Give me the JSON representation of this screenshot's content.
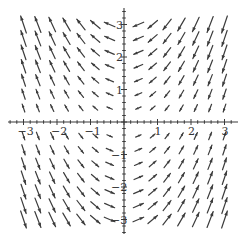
{
  "chart_data": {
    "type": "vector-field",
    "title": "",
    "xlabel": "",
    "ylabel": "",
    "field": {
      "u": "-y",
      "v": "-x*y"
    },
    "xlim": [
      -3.4,
      3.4
    ],
    "ylim": [
      -3.5,
      3.6
    ],
    "grid": false,
    "legend": null,
    "x_ticks": [
      -3,
      -2,
      -1,
      1,
      2,
      3
    ],
    "y_ticks": [
      -3,
      -2,
      -1,
      1,
      2,
      3
    ],
    "x_tick_labels": [
      "−3",
      "−2",
      "−1",
      "1",
      "2",
      "3"
    ],
    "y_tick_labels": [
      "−3",
      "−2",
      "−1",
      "1",
      "2",
      "3"
    ],
    "arrow_grid": {
      "x": [
        -3.0,
        -2.571,
        -2.143,
        -1.714,
        -1.286,
        -0.857,
        -0.429,
        0.429,
        0.857,
        1.286,
        1.714,
        2.143,
        2.571,
        3.0
      ],
      "y": [
        -3.0,
        -2.571,
        -2.143,
        -1.714,
        -1.286,
        -0.857,
        -0.429,
        0.429,
        0.857,
        1.286,
        1.714,
        2.143,
        2.571,
        3.0
      ]
    },
    "colors": {
      "arrow": "#3c3c3c",
      "axis": "#3a3a3a",
      "background": "#ffffff"
    }
  },
  "a11y": {
    "description": "Vector field plot on axes from -3 to 3 showing arrows for the field (-y, -x y)."
  }
}
